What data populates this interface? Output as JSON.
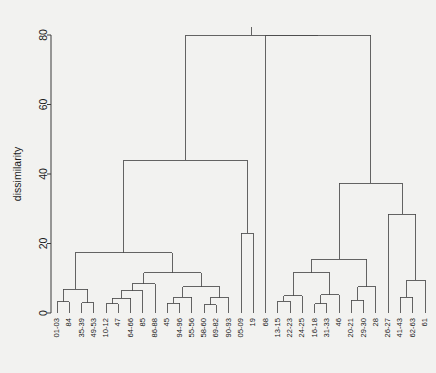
{
  "figure": {
    "background_color": "#f2f2f0",
    "line_color": "#4a4a4a",
    "text_color": "#1a1a1a"
  },
  "chart_data": {
    "type": "dendrogram",
    "title": "",
    "xlabel": "",
    "ylabel": "dissimilarity",
    "ylim": [
      0,
      83
    ],
    "yticks": [
      0,
      20,
      40,
      60,
      80
    ],
    "ytick_labels": [
      "0",
      "20",
      "40",
      "60",
      "80"
    ],
    "grid": false,
    "legend": null,
    "orientation": "vertical",
    "leaf_labels": [
      "01-03",
      "84",
      "35-39",
      "49-53",
      "10-12",
      "47",
      "64-66",
      "85",
      "86-88",
      "45",
      "94-96",
      "55-56",
      "58-60",
      "69-82",
      "90-93",
      "05-09",
      "19",
      "68",
      "13-15",
      "22-23",
      "24-25",
      "16-18",
      "31-33",
      "46",
      "20-21",
      "29-30",
      "28",
      "26-27",
      "41-43",
      "62-63",
      "61"
    ],
    "leaf_count": 31,
    "merges": [
      {
        "id": "m1",
        "left": "01-03",
        "right": "84",
        "height": 3.2
      },
      {
        "id": "m2",
        "left": "35-39",
        "right": "49-53",
        "height": 3.0
      },
      {
        "id": "m3",
        "left": "m1",
        "right": "m2",
        "height": 6.8
      },
      {
        "id": "m4",
        "left": "10-12",
        "right": "47",
        "height": 2.6
      },
      {
        "id": "m5",
        "left": "m4",
        "right": "64-66",
        "height": 4.2
      },
      {
        "id": "m6",
        "left": "m5",
        "right": "85",
        "height": 6.4
      },
      {
        "id": "m7",
        "left": "m6",
        "right": "86-88",
        "height": 8.4
      },
      {
        "id": "m8",
        "left": "45",
        "right": "94-96",
        "height": 2.8
      },
      {
        "id": "m9",
        "left": "m8",
        "right": "55-56",
        "height": 4.6
      },
      {
        "id": "m10",
        "left": "58-60",
        "right": "69-82",
        "height": 2.4
      },
      {
        "id": "m11",
        "left": "m10",
        "right": "90-93",
        "height": 4.4
      },
      {
        "id": "m12",
        "left": "m9",
        "right": "m11",
        "height": 7.6
      },
      {
        "id": "m13",
        "left": "m7",
        "right": "m12",
        "height": 11.6
      },
      {
        "id": "m14",
        "left": "m3",
        "right": "m13",
        "height": 17.4
      },
      {
        "id": "m15",
        "left": "05-09",
        "right": "19",
        "height": 23.0
      },
      {
        "id": "m16",
        "left": "m14",
        "right": "m15",
        "height": 44.0
      },
      {
        "id": "m17",
        "left": "13-15",
        "right": "22-23",
        "height": 3.4
      },
      {
        "id": "m18",
        "left": "m17",
        "right": "24-25",
        "height": 5.0
      },
      {
        "id": "m19",
        "left": "16-18",
        "right": "31-33",
        "height": 2.6
      },
      {
        "id": "m20",
        "left": "m19",
        "right": "46",
        "height": 5.2
      },
      {
        "id": "m21",
        "left": "m18",
        "right": "m20",
        "height": 11.6
      },
      {
        "id": "m22",
        "left": "20-21",
        "right": "29-30",
        "height": 3.6
      },
      {
        "id": "m23",
        "left": "m22",
        "right": "28",
        "height": 7.6
      },
      {
        "id": "m24",
        "left": "m21",
        "right": "m23",
        "height": 15.4
      },
      {
        "id": "m25",
        "left": "41-43",
        "right": "62-63",
        "height": 4.6
      },
      {
        "id": "m26",
        "left": "m25",
        "right": "61",
        "height": 9.4
      },
      {
        "id": "m27",
        "left": "26-27",
        "right": "m26",
        "height": 28.4
      },
      {
        "id": "m28",
        "left": "m24",
        "right": "m27",
        "height": 37.4
      },
      {
        "id": "m29",
        "left": "68",
        "right": "m28",
        "height": 80.0
      },
      {
        "id": "m30",
        "left": "m16",
        "right": "m29",
        "height": 80.0
      }
    ],
    "root": "m30"
  }
}
